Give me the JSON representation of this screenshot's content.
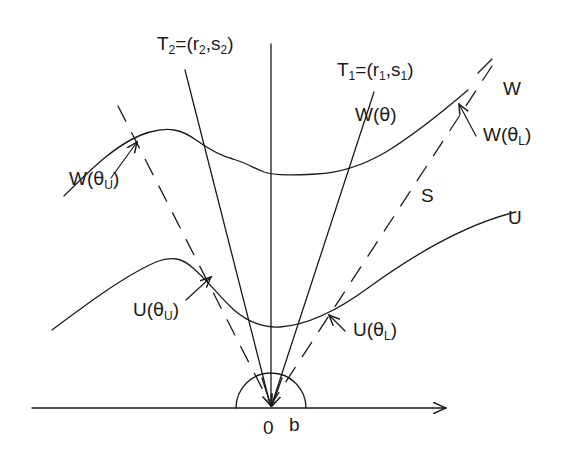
{
  "figure": {
    "kind": "geometric-diagram",
    "background_color": "#ffffff",
    "stroke_color": "#1a1a1a",
    "axis": {
      "label_origin": "0",
      "label_b": "b",
      "has_right_arrowhead": true
    },
    "labels": {
      "tangent_2": "T₂=(r₂,s₂)",
      "tangent_1": "T₁=(r₁,s₁)",
      "w_curve": "W",
      "u_curve": "U",
      "region_s": "S",
      "w_theta": "W(θ)",
      "w_theta_lower": "W(θₗ)",
      "w_theta_upper": "W(θᵤ)",
      "u_theta_lower": "U(θₗ)",
      "u_theta_upper": "U(θᵤ)"
    },
    "label_parts": {
      "tangent_2": {
        "base": "T",
        "sub1": "2",
        "mid": "=(r",
        "sub2": "2",
        "comma": ",s",
        "sub3": "2",
        "close": ")"
      },
      "tangent_1": {
        "base": "T",
        "sub1": "1",
        "mid": "=(r",
        "sub2": "1",
        "comma": ",s",
        "sub3": "1",
        "close": ")"
      },
      "w_theta": {
        "base": "W(",
        "greek": "θ",
        "close": ")"
      },
      "w_theta_lower": {
        "base": "W(",
        "greek": "θ",
        "sub": "L",
        "close": ")"
      },
      "w_theta_upper": {
        "base": "W(",
        "greek": "θ",
        "sub": "U",
        "close": ")"
      },
      "u_theta_lower": {
        "base": "U(",
        "greek": "θ",
        "sub": "L",
        "close": ")"
      },
      "u_theta_upper": {
        "base": "U(",
        "greek": "θ",
        "sub": "U",
        "close": ")"
      }
    }
  }
}
